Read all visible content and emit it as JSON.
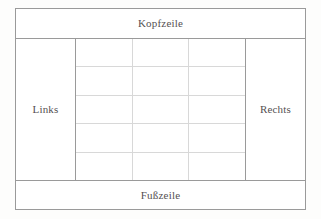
{
  "diagram": {
    "regions": {
      "header": {
        "label": "Kopfzeile"
      },
      "footer": {
        "label": "Fußzeile"
      },
      "left": {
        "label": "Links"
      },
      "right": {
        "label": "Rechts"
      }
    },
    "content_grid": {
      "columns": 3,
      "rows": 5,
      "cells": [
        [
          "",
          "",
          ""
        ],
        [
          "",
          "",
          ""
        ],
        [
          "",
          "",
          ""
        ],
        [
          "",
          "",
          ""
        ],
        [
          "",
          "",
          ""
        ]
      ]
    },
    "colors": {
      "outer_border": "#9a9a9a",
      "grid_line": "#d8d8d8",
      "text": "#555052",
      "fill": "#ffffff",
      "page_background": "#fdfdfc"
    }
  }
}
